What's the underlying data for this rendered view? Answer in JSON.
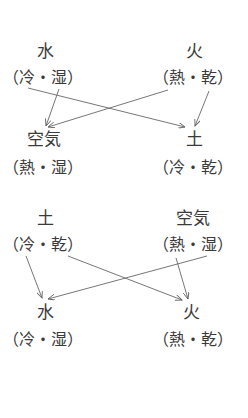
{
  "diagrams": [
    {
      "name": "top",
      "nodes": [
        {
          "id": "water",
          "element": "水",
          "qualities": "（冷・湿）"
        },
        {
          "id": "fire",
          "element": "火",
          "qualities": "（熱・乾）"
        },
        {
          "id": "air",
          "element": "空気",
          "qualities": "（熱・湿）"
        },
        {
          "id": "earth",
          "element": "土",
          "qualities": "（冷・乾）"
        }
      ],
      "edges": [
        {
          "from": "water",
          "to": "air"
        },
        {
          "from": "fire",
          "to": "air"
        },
        {
          "from": "water",
          "to": "earth"
        },
        {
          "from": "fire",
          "to": "earth"
        }
      ]
    },
    {
      "name": "bottom",
      "nodes": [
        {
          "id": "earth",
          "element": "土",
          "qualities": "（冷・乾）"
        },
        {
          "id": "air",
          "element": "空気",
          "qualities": "（熱・湿）"
        },
        {
          "id": "water",
          "element": "水",
          "qualities": "（冷・湿）"
        },
        {
          "id": "fire",
          "element": "火",
          "qualities": "（熱・乾）"
        }
      ],
      "edges": [
        {
          "from": "earth",
          "to": "water"
        },
        {
          "from": "air",
          "to": "water"
        },
        {
          "from": "earth",
          "to": "fire"
        },
        {
          "from": "air",
          "to": "fire"
        }
      ]
    }
  ],
  "colors": {
    "text": "#3a3a3a",
    "arrow": "#666666"
  }
}
